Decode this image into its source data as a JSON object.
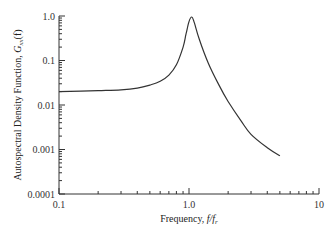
{
  "chart_data": {
    "type": "line",
    "title": "",
    "xlabel": "Frequency, f/f_r",
    "ylabel": "Autospectral Density Function, G_xx(f)",
    "xscale": "log",
    "yscale": "log",
    "xlim": [
      0.1,
      10
    ],
    "ylim": [
      0.0001,
      1.0
    ],
    "x_ticks": [
      "0.1",
      "1.0",
      "10"
    ],
    "y_ticks": [
      "1.0",
      "0.1",
      "0.01",
      "0.001",
      "0.0001"
    ],
    "grid": false,
    "legend": null,
    "series": [
      {
        "name": "G_xx(f)",
        "x": [
          0.1,
          0.2,
          0.3,
          0.4,
          0.5,
          0.6,
          0.7,
          0.8,
          0.9,
          0.95,
          1.0,
          1.05,
          1.1,
          1.2,
          1.4,
          1.7,
          2.0,
          2.5,
          3.0,
          4.0,
          5.0
        ],
        "y": [
          0.02,
          0.021,
          0.022,
          0.024,
          0.028,
          0.034,
          0.047,
          0.08,
          0.2,
          0.4,
          0.75,
          0.95,
          0.7,
          0.3,
          0.09,
          0.028,
          0.012,
          0.0045,
          0.0022,
          0.0011,
          0.00072
        ]
      }
    ]
  },
  "labels": {
    "x_axis_title_prefix": "Frequency, ",
    "x_axis_title_var": "f/f",
    "x_axis_title_sub": "r",
    "y_axis_title_prefix": "Autospectral Density Function, ",
    "y_axis_title_var": "G",
    "y_axis_title_sub": "xx",
    "y_axis_title_suffix": "(f)"
  }
}
